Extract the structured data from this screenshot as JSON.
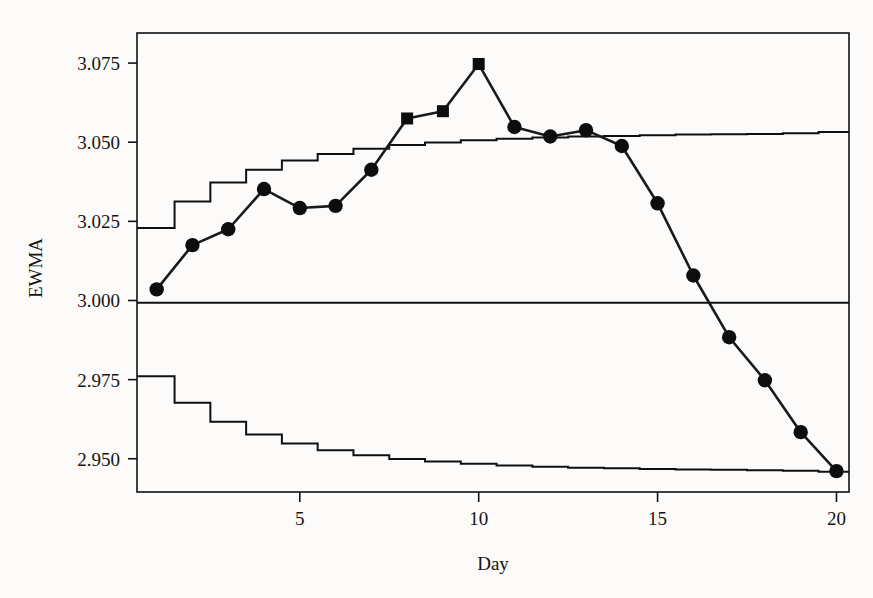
{
  "chart_data": {
    "type": "line",
    "title": "",
    "subtitle": "",
    "xlabel": "Day",
    "ylabel": "EWMA",
    "xlim": [
      0.45,
      20.35
    ],
    "ylim": [
      2.9395,
      3.0845
    ],
    "grid": false,
    "legend": null,
    "x_ticks": [
      5,
      10,
      15,
      20
    ],
    "x_tick_labels": [
      "5",
      "10",
      "15",
      "20"
    ],
    "y_ticks": [
      2.95,
      2.975,
      3.0,
      3.025,
      3.05,
      3.075
    ],
    "y_tick_labels": [
      "2.950",
      "2.975",
      "3.000",
      "3.025",
      "3.050",
      "3.075"
    ],
    "x": [
      1,
      2,
      3,
      4,
      5,
      6,
      7,
      8,
      9,
      10,
      11,
      12,
      13,
      14,
      15,
      16,
      17,
      18,
      19,
      20
    ],
    "series": [
      {
        "name": "EWMA",
        "values": [
          3.0035,
          3.0175,
          3.0225,
          3.0352,
          3.0292,
          3.0299,
          3.0413,
          3.0575,
          3.0598,
          3.0747,
          3.0548,
          3.0518,
          3.0538,
          3.0488,
          3.0307,
          3.0079,
          2.9884,
          2.9748,
          2.9584,
          2.9461
        ],
        "marker_shapes": [
          "circle",
          "circle",
          "circle",
          "circle",
          "circle",
          "circle",
          "circle",
          "square",
          "square",
          "square",
          "circle",
          "circle",
          "circle",
          "circle",
          "circle",
          "circle",
          "circle",
          "circle",
          "circle",
          "circle"
        ],
        "marker_note": "square markers denote out-of-control points above the upper control limit"
      },
      {
        "name": "UCL",
        "type": "step",
        "values": [
          3.0229,
          3.0313,
          3.0373,
          3.0413,
          3.0442,
          3.0463,
          3.0479,
          3.0491,
          3.0499,
          3.0506,
          3.0511,
          3.0515,
          3.0518,
          3.052,
          3.0522,
          3.0524,
          3.0525,
          3.0526,
          3.0528,
          3.0532
        ]
      },
      {
        "name": "Center line",
        "type": "horizontal",
        "value": 2.9993
      },
      {
        "name": "LCL",
        "type": "step",
        "values": [
          2.9761,
          2.9677,
          2.9617,
          2.9577,
          2.9548,
          2.9527,
          2.9511,
          2.9499,
          2.9491,
          2.9484,
          2.9479,
          2.9475,
          2.9472,
          2.947,
          2.9468,
          2.9466,
          2.9465,
          2.9464,
          2.9462,
          2.9459
        ]
      }
    ],
    "annotations": []
  },
  "colors": {
    "ink": "#101010",
    "marker": "#0d0d0d",
    "background": "#fcfbfa"
  }
}
